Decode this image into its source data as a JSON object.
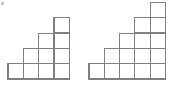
{
  "figure": {
    "background_color": "#ffffff",
    "line_color": "#808080",
    "cell_fill": "#ffffff",
    "line_width": 1.2,
    "cell_size": 15.3,
    "baseline_y": 79,
    "corner_mark_color": "#9a9a9a",
    "shapes": [
      {
        "name": "left-staircase",
        "label": "Left staircase",
        "origin_x": 8,
        "column_heights": [
          1,
          2,
          3,
          4
        ],
        "columns": 4,
        "max_height": 4,
        "cell_count": 10
      },
      {
        "name": "right-staircase",
        "label": "Right staircase",
        "origin_x": 89,
        "column_heights": [
          1,
          2,
          3,
          4,
          5
        ],
        "columns": 5,
        "max_height": 5,
        "cell_count": 15
      }
    ]
  },
  "chart_data": {
    "type": "bar",
    "xlabel": "",
    "ylabel": "",
    "grid": true,
    "legend": "none",
    "series": [
      {
        "name": "Left staircase",
        "categories": [
          "1",
          "2",
          "3",
          "4"
        ],
        "values": [
          1,
          2,
          3,
          4
        ]
      },
      {
        "name": "Right staircase",
        "categories": [
          "1",
          "2",
          "3",
          "4",
          "5"
        ],
        "values": [
          1,
          2,
          3,
          4,
          5
        ]
      }
    ],
    "ylim": [
      0,
      5
    ]
  }
}
